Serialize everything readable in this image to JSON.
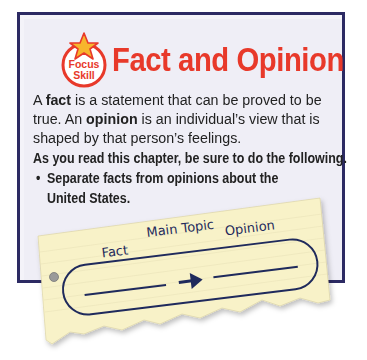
{
  "badge": {
    "line1": "Focus",
    "line2": "Skill",
    "icon": "star-icon"
  },
  "title": "Fact and Opinion",
  "definition": {
    "line1_a": "A ",
    "line1_b": "fact",
    "line1_c": " is a statement that can be proved to be",
    "line2_a": "true. An ",
    "line2_b": "opinion",
    "line2_c": " is an individual’s view that is",
    "line3": "shaped by that person’s feelings."
  },
  "instruction": "As you read this chapter, be sure to do the following.",
  "bullets": [
    {
      "marker": "•",
      "line1": "Separate facts from opinions about the",
      "line2": "United States."
    }
  ],
  "organizer": {
    "label_main": "Main Topic",
    "label_fact": "Fact",
    "label_opinion": "Opinion",
    "arrow": "right-arrow-icon"
  },
  "colors": {
    "title": "#e8392a",
    "border": "#2c2a63",
    "box_bg": "#efeef6",
    "note_bg": "#f8f2c8",
    "ink": "#1f2a5c"
  }
}
